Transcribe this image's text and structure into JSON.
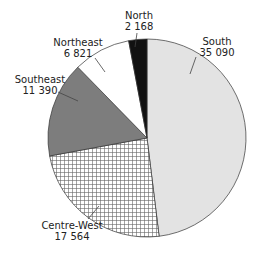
{
  "chart_data": {
    "type": "pie",
    "title": "",
    "start_angle": "12 o'clock, clockwise",
    "slices": [
      {
        "label": "South",
        "value": 35090,
        "value_text": "35 090",
        "fill": "light-gray",
        "color": "#e3e3e3"
      },
      {
        "label": "Centre-West",
        "value": 17564,
        "value_text": "17 564",
        "fill": "crosshatch",
        "color": "#ffffff"
      },
      {
        "label": "Southeast",
        "value": 11390,
        "value_text": "11 390",
        "fill": "dark-gray",
        "color": "#7d7d7d"
      },
      {
        "label": "Northeast",
        "value": 6821,
        "value_text": "6 821",
        "fill": "white",
        "color": "#ffffff"
      },
      {
        "label": "North",
        "value": 2168,
        "value_text": "2 168",
        "fill": "black",
        "color": "#111111"
      }
    ]
  }
}
